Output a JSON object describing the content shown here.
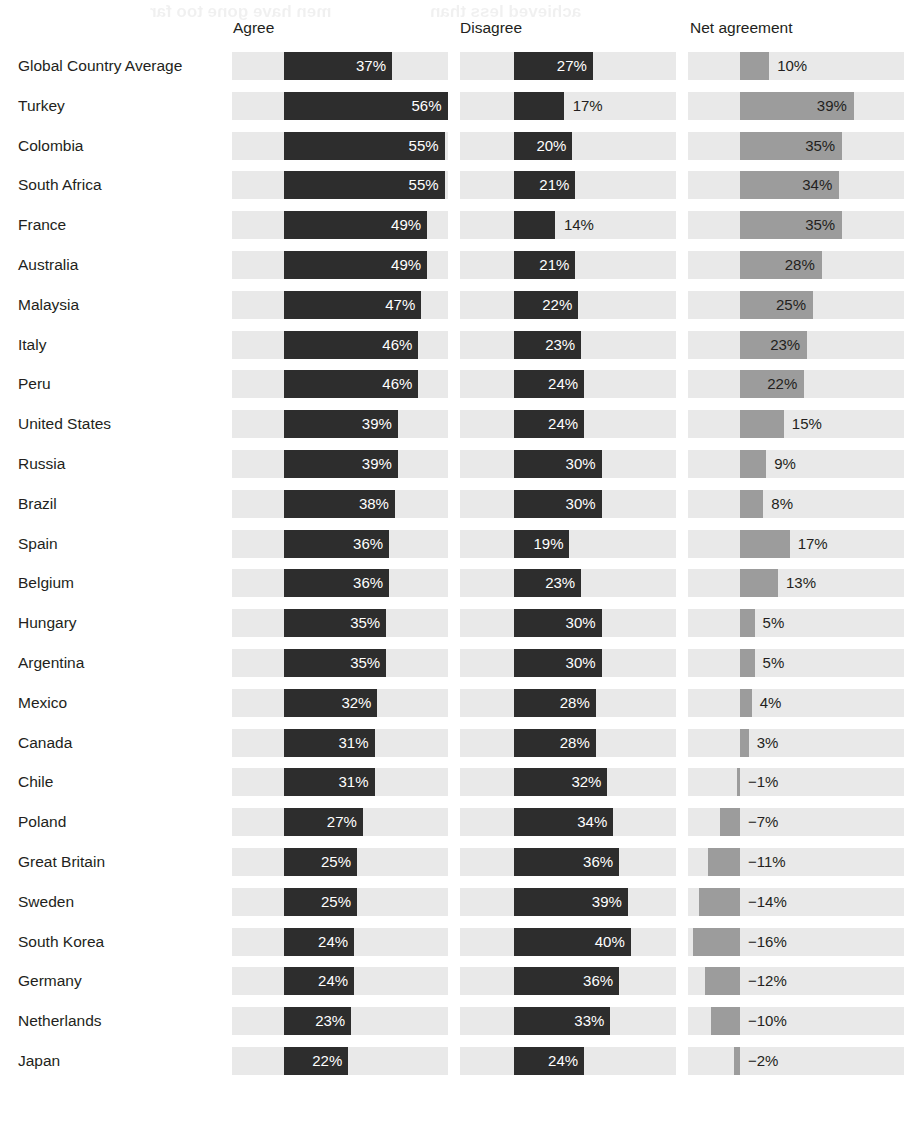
{
  "headers": {
    "agree": "Agree",
    "disagree": "Disagree",
    "net": "Net agreement"
  },
  "ghost_text": [
    "men have gone too far",
    "achieved less than"
  ],
  "colors": {
    "bar_dark": "#2d2d2d",
    "bar_mid": "#9c9c9c",
    "track": "#e9e9e9",
    "text": "#231f20",
    "background": "#ffffff"
  },
  "chart_data": {
    "type": "bar",
    "title": "",
    "xlabel": "",
    "ylabel": "",
    "orientation": "horizontal",
    "grid": false,
    "legend_position": "none",
    "panels": [
      "Agree",
      "Disagree",
      "Net agreement"
    ],
    "categories": [
      "Global Country Average",
      "Turkey",
      "Colombia",
      "South Africa",
      "France",
      "Australia",
      "Malaysia",
      "Italy",
      "Peru",
      "United States",
      "Russia",
      "Brazil",
      "Spain",
      "Belgium",
      "Hungary",
      "Argentina",
      "Mexico",
      "Canada",
      "Chile",
      "Poland",
      "Great Britain",
      "Sweden",
      "South Korea",
      "Germany",
      "Netherlands",
      "Japan"
    ],
    "series": [
      {
        "name": "Agree",
        "values": [
          37,
          56,
          55,
          55,
          49,
          49,
          47,
          46,
          46,
          39,
          39,
          38,
          36,
          36,
          35,
          35,
          32,
          31,
          31,
          27,
          25,
          25,
          24,
          24,
          23,
          22
        ],
        "labels": [
          "37%",
          "56%",
          "55%",
          "55%",
          "49%",
          "49%",
          "47%",
          "46%",
          "46%",
          "39%",
          "39%",
          "38%",
          "36%",
          "36%",
          "35%",
          "35%",
          "32%",
          "31%",
          "31%",
          "27%",
          "25%",
          "25%",
          "24%",
          "24%",
          "23%",
          "22%"
        ]
      },
      {
        "name": "Disagree",
        "values": [
          27,
          17,
          20,
          21,
          14,
          21,
          22,
          23,
          24,
          24,
          30,
          30,
          19,
          23,
          30,
          30,
          28,
          28,
          32,
          34,
          36,
          39,
          40,
          36,
          33,
          24
        ],
        "labels": [
          "27%",
          "17%",
          "20%",
          "21%",
          "14%",
          "21%",
          "22%",
          "23%",
          "24%",
          "24%",
          "30%",
          "30%",
          "19%",
          "23%",
          "30%",
          "30%",
          "28%",
          "28%",
          "32%",
          "34%",
          "36%",
          "39%",
          "40%",
          "36%",
          "33%",
          "24%"
        ]
      },
      {
        "name": "Net agreement",
        "values": [
          10,
          39,
          35,
          34,
          35,
          28,
          25,
          23,
          22,
          15,
          9,
          8,
          17,
          13,
          5,
          5,
          4,
          3,
          -1,
          -7,
          -11,
          -14,
          -16,
          -12,
          -10,
          -2
        ],
        "labels": [
          "10%",
          "39%",
          "35%",
          "34%",
          "35%",
          "28%",
          "25%",
          "23%",
          "22%",
          "15%",
          "9%",
          "8%",
          "17%",
          "13%",
          "5%",
          "5%",
          "4%",
          "3%",
          "−1%",
          "−7%",
          "−11%",
          "−14%",
          "−16%",
          "−12%",
          "−10%",
          "−2%"
        ]
      }
    ],
    "value_unit": "%"
  },
  "layout": {
    "row_start_y": 46,
    "row_height": 39.8,
    "agree_track_left": 232,
    "agree_bar_left": 284,
    "disagree_track_left": 460,
    "disagree_bar_left": 514,
    "net_track_left": 688,
    "net_zero_x": 740,
    "track_width": 216,
    "px_per_percent_main": 2.92,
    "px_per_percent_net": 2.92
  }
}
